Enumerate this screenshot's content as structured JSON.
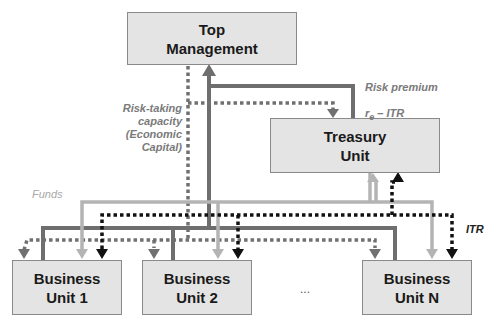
{
  "nodes": {
    "top_management": "Top\nManagement",
    "treasury": "Treasury\nUnit",
    "bu1": "Business\nUnit 1",
    "bu2": "Business\nUnit 2",
    "bun": "Business\nUnit N",
    "ellipsis": "..."
  },
  "labels": {
    "risk_premium_line1": "Risk premium",
    "risk_premium_line2_base": "r",
    "risk_premium_line2_sub": "e",
    "risk_premium_line2_rest": " – ITR",
    "risk_taking": "Risk-taking\ncapacity\n(Economic\nCapital)",
    "funds": "Funds",
    "itr": "ITR"
  },
  "colors": {
    "box_fill": "#e4e4e4",
    "risk_premium_line": "#6e6e6e",
    "capacity_line": "#707070",
    "funds_line": "#b4b4b4",
    "itr_line": "#111111"
  }
}
